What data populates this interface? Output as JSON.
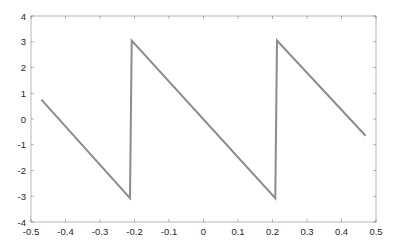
{
  "chart_data": {
    "type": "line",
    "title": "",
    "xlabel": "",
    "ylabel": "",
    "xlim": [
      -0.5,
      0.5
    ],
    "ylim": [
      -4,
      4
    ],
    "grid": false,
    "legend": null,
    "xticks": [
      -0.5,
      -0.4,
      -0.3,
      -0.2,
      -0.1,
      0,
      0.1,
      0.2,
      0.3,
      0.4,
      0.5
    ],
    "xtick_labels": [
      "-0.5",
      "-0.4",
      "-0.3",
      "-0.2",
      "-0.1",
      "0",
      "0.1",
      "0.2",
      "0.3",
      "0.4",
      "0.5"
    ],
    "yticks": [
      -4,
      -3,
      -2,
      -1,
      0,
      1,
      2,
      3,
      4
    ],
    "ytick_labels": [
      "-4",
      "-3",
      "-2",
      "-1",
      "0",
      "1",
      "2",
      "3",
      "4"
    ],
    "series": [
      {
        "name": "sawtooth",
        "color": "#8c8c8c",
        "x": [
          -0.47,
          -0.213,
          -0.208,
          0.208,
          0.213,
          0.47
        ],
        "y": [
          0.75,
          -3.07,
          3.05,
          -3.07,
          3.05,
          -0.65
        ]
      }
    ]
  },
  "style": {
    "axis_color": "#262626",
    "line_color": "#8c8c8c",
    "background": "#ffffff"
  }
}
